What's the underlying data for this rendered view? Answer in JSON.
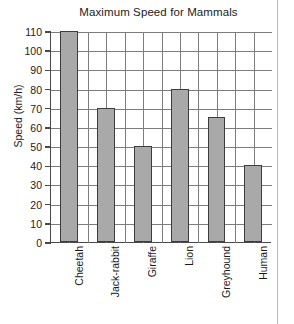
{
  "chart_data": {
    "type": "bar",
    "title": "Maximum Speed for Mammals",
    "xlabel": "",
    "ylabel": "Speed (km/h)",
    "categories": [
      "Cheetah",
      "Jack-rabbit",
      "Giraffe",
      "Lion",
      "Greyhound",
      "Human"
    ],
    "values": [
      110,
      70,
      50,
      80,
      65,
      40
    ],
    "ylim": [
      0,
      110
    ],
    "ytick_step": 10,
    "yticks": [
      0,
      10,
      20,
      30,
      40,
      50,
      60,
      70,
      80,
      90,
      100,
      110
    ],
    "ytick_labels": [
      "0",
      "10",
      "20",
      "30",
      "40",
      "50",
      "60",
      "70",
      "80",
      "90",
      "100",
      "110"
    ],
    "grid": "both",
    "legend": "none",
    "bar_color": "#a9a9a9",
    "bar_edge_color": "#3d3d3d",
    "axis_color": "#4a4a4a",
    "grid_color": "#7d7d7d",
    "background": "#ffffff"
  }
}
